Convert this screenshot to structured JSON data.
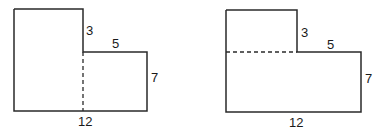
{
  "figures": [
    {
      "name": "left-figure",
      "split": "vertical",
      "labels": {
        "top_step": "3",
        "step_width": "5",
        "right_height": "7",
        "bottom_width": "12"
      }
    },
    {
      "name": "right-figure",
      "split": "horizontal",
      "labels": {
        "top_step": "3",
        "step_width": "5",
        "right_height": "7",
        "bottom_width": "12"
      }
    }
  ],
  "colors": {
    "stroke": "#2a2a2a",
    "background": "#ffffff"
  }
}
